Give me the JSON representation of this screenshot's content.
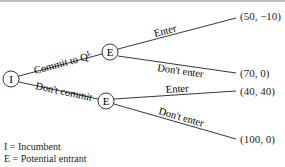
{
  "diagram": {
    "type": "game-tree",
    "nodes": {
      "root": {
        "label": "I"
      },
      "upper": {
        "label": "E"
      },
      "lower": {
        "label": "E"
      }
    },
    "edges": {
      "commit": {
        "label_main": "Commit to Q",
        "label_sup": "L"
      },
      "dont_commit": {
        "label": "Don't commit"
      },
      "upper_enter": {
        "label": "Enter"
      },
      "upper_dont_enter": {
        "label": "Don't enter"
      },
      "lower_enter": {
        "label": "Enter"
      },
      "lower_dont_enter": {
        "label": "Don't enter"
      }
    },
    "payoffs": [
      {
        "id": "commit-enter",
        "text": "(50, −10)"
      },
      {
        "id": "commit-dont-enter",
        "text": "(70, 0)"
      },
      {
        "id": "dont-commit-enter",
        "text": "(40, 40)"
      },
      {
        "id": "dont-commit-dont-enter",
        "text": "(100, 0)"
      }
    ],
    "legend": [
      {
        "symbol": "I",
        "text": "= Incumbent"
      },
      {
        "symbol": "E",
        "text": "= Potential entrant"
      }
    ]
  },
  "colors": {
    "line": "#231f20",
    "top_rule": "#bdbdbd",
    "background": "#ffffff"
  }
}
